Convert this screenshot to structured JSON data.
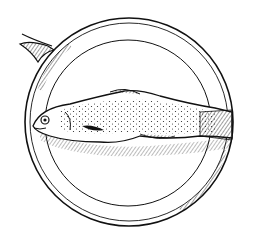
{
  "illustration": {
    "subject": "Fish on a round pan",
    "style": "pen-and-ink line drawing",
    "ink_color": "#111111",
    "background_color": "#ffffff",
    "elements": [
      "pan-handle",
      "pan-outer-rim",
      "pan-inner-rim",
      "fish"
    ]
  }
}
